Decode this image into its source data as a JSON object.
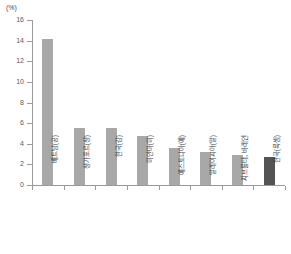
{
  "chart_data": {
    "type": "bar",
    "title": "",
    "subtitle": "",
    "xlabel": "",
    "ylabel": "",
    "unit_label": "(%)",
    "ylim": [
      0,
      16
    ],
    "ytick_step": 2,
    "yticks": [
      0,
      2,
      4,
      6,
      8,
      10,
      12,
      14,
      16
    ],
    "ytick_labels": [
      "0",
      "2",
      "4",
      "6",
      "8",
      "10",
      "12",
      "14",
      "16"
    ],
    "grid": false,
    "legend": null,
    "categories": [
      "베트남(공)",
      "싱가포르(싱)",
      "한국(감)",
      "미얀마(미)",
      "에스토니아(에)",
      "말레이시아(말)",
      "지브롤터, 바레인",
      "한국(룩셈)"
    ],
    "values": [
      14.2,
      5.5,
      5.5,
      4.8,
      3.6,
      3.2,
      2.9,
      2.7
    ],
    "series": [
      {
        "name": "비중",
        "values": [
          14.2,
          5.5,
          5.5,
          4.8,
          3.6,
          3.2,
          2.9,
          2.7
        ]
      }
    ],
    "bar_colors": [
      "#a8a8a8",
      "#a8a8a8",
      "#a8a8a8",
      "#a8a8a8",
      "#a8a8a8",
      "#a8a8a8",
      "#a8a8a8",
      "#545454"
    ],
    "highlight_index": 7,
    "colors": {
      "bar_default": "#a8a8a8",
      "bar_highlight": "#545454",
      "axis": "#9a9a9a",
      "text": "#3c3c3c",
      "background": "#ffffff"
    }
  }
}
